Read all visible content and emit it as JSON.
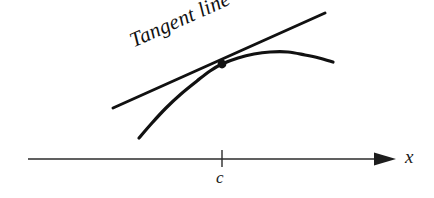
{
  "figure": {
    "kind": "calculus-tangent-line-diagram",
    "background_color": "#ffffff",
    "ink_color": "#111111",
    "axis_color": "#2b2b2b",
    "width": 434,
    "height": 198
  },
  "annotations": {
    "tangent_label": "Tangent line",
    "tangent_label_rotation_deg": -24
  },
  "axis": {
    "label": "x",
    "line_y": 159,
    "start_x": 28,
    "end_x": 378,
    "arrow_tip_x": 396,
    "tick": {
      "label": "c",
      "x": 222,
      "top_y": 150,
      "bottom_y": 167
    }
  },
  "chart_data": {
    "type": "line",
    "title": "",
    "xlabel": "x",
    "ylabel": "",
    "grid": false,
    "legend": null,
    "annotations": [
      {
        "text": "Tangent line",
        "at": [
          196,
          46
        ],
        "rotation_deg": -24
      },
      {
        "text": "c",
        "at": [
          222,
          180
        ]
      },
      {
        "text": "x",
        "at": [
          412,
          158
        ]
      }
    ],
    "series": [
      {
        "name": "curve",
        "kind": "curve",
        "stroke_width": 3.2,
        "points": [
          [
            139,
            138
          ],
          [
            152,
            123
          ],
          [
            166,
            108
          ],
          [
            181,
            94
          ],
          [
            197,
            81
          ],
          [
            210,
            71
          ],
          [
            222,
            64
          ],
          [
            238,
            58
          ],
          [
            254,
            54
          ],
          [
            270,
            52
          ],
          [
            288,
            52
          ],
          [
            305,
            55
          ],
          [
            319,
            58
          ],
          [
            333,
            62
          ]
        ]
      },
      {
        "name": "tangent line",
        "kind": "line",
        "stroke_width": 3.0,
        "points": [
          [
            113,
            108
          ],
          [
            325,
            13
          ]
        ],
        "slope_screen": -0.448
      }
    ],
    "markers": [
      {
        "name": "tangent point",
        "x": 222,
        "y": 64,
        "radius": 4.4,
        "fill": "#111111"
      }
    ]
  }
}
